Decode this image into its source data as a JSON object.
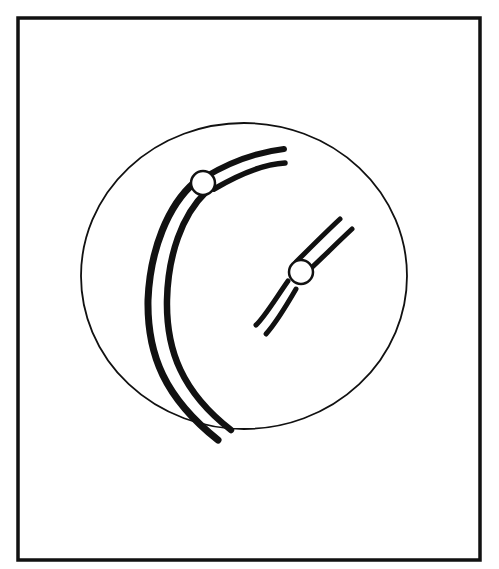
{
  "diagram": {
    "colors": {
      "ink": "#111111",
      "background": "#ffffff"
    },
    "elements": [
      {
        "id": "frame",
        "type": "rectangle"
      },
      {
        "id": "cell-membrane",
        "type": "ellipse"
      },
      {
        "id": "large-chromosome",
        "type": "chromosome",
        "centromere": "near one end (acrocentric/submetacentric)"
      },
      {
        "id": "small-chromosome",
        "type": "chromosome",
        "centromere": "near middle (metacentric)"
      }
    ]
  }
}
